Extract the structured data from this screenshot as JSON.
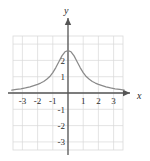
{
  "chart_data": {
    "type": "line",
    "title": "",
    "xlabel": "x",
    "ylabel": "y",
    "xlim": [
      -3.7,
      3.7
    ],
    "ylim": [
      -3.5,
      3.5
    ],
    "grid": true,
    "grid_step": 1,
    "legend": null,
    "x_tick_labels": [
      "-3",
      "-2",
      "-1",
      "1",
      "2",
      "3"
    ],
    "x_tick_values": [
      -3,
      -2,
      -1,
      1,
      2,
      3
    ],
    "y_tick_labels": [
      "2",
      "1",
      "-1",
      "-2",
      "-3"
    ],
    "y_tick_values": [
      2,
      1,
      -1,
      -2,
      -3
    ],
    "series": [
      {
        "name": "curve",
        "color": "#8a8a8a",
        "x": [
          -3.7,
          -3.4,
          -3.1,
          -2.8,
          -2.5,
          -2.2,
          -2.0,
          -1.8,
          -1.6,
          -1.4,
          -1.2,
          -1.0,
          -0.8,
          -0.6,
          -0.4,
          -0.2,
          0.0,
          0.2,
          0.4,
          0.6,
          0.8,
          1.0,
          1.2,
          1.4,
          1.6,
          1.8,
          2.0,
          2.2,
          2.5,
          2.8,
          3.1,
          3.4,
          3.7
        ],
        "y": [
          0.18,
          0.22,
          0.26,
          0.31,
          0.38,
          0.47,
          0.53,
          0.61,
          0.71,
          0.84,
          1.01,
          1.25,
          1.56,
          1.92,
          2.28,
          2.53,
          2.6,
          2.53,
          2.28,
          1.92,
          1.56,
          1.25,
          1.01,
          0.84,
          0.71,
          0.61,
          0.53,
          0.47,
          0.38,
          0.31,
          0.26,
          0.22,
          0.18
        ]
      }
    ],
    "annotations": []
  },
  "axes": {
    "x_axis_name": "x",
    "y_axis_name": "y"
  },
  "colors": {
    "curve": "#8a8a8a",
    "grid": "#d9d9d9",
    "axis": "#555555",
    "text": "#2b2b2b",
    "background": "#ffffff"
  }
}
